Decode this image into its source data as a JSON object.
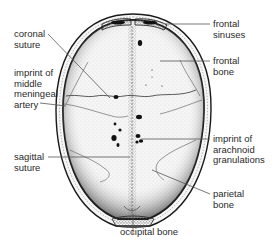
{
  "diagram": {
    "labels": {
      "coronal_suture": [
        "coronal",
        "suture"
      ],
      "middle_meningeal": [
        "imprint of",
        "middle",
        "meningeal",
        "artery"
      ],
      "sagittal_suture": [
        "sagittal",
        "suture"
      ],
      "frontal_sinuses": [
        "frontal",
        "sinuses"
      ],
      "frontal_bone": [
        "frontal",
        "bone"
      ],
      "arachnoid": [
        "imprint of",
        "arachnoid",
        "granulations"
      ],
      "parietal_bone": [
        "parietal",
        "bone"
      ],
      "occipital_bone": "occipital bone"
    },
    "colors": {
      "ink": "#1a1a1a",
      "label_text": "#2a2a2a",
      "leader_line": "#555555",
      "background": "#ffffff"
    }
  }
}
